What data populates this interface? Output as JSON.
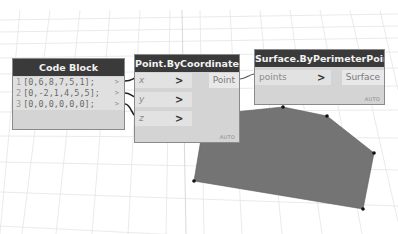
{
  "workspace": {
    "background": "#ffffff",
    "grid_color": "#e4e4e4",
    "geometry": {
      "surface_fill": "#747474",
      "vertices": [
        [
          283,
          107
        ],
        [
          327,
          116
        ],
        [
          374,
          153
        ],
        [
          363,
          209
        ],
        [
          194,
          181
        ]
      ]
    }
  },
  "nodes": {
    "code_block": {
      "title": "Code Block",
      "lines": [
        {
          "number": "1",
          "code": "[0,6,8,7,5,1];",
          "output_marker": ">"
        },
        {
          "number": "2",
          "code": "[0,-2,1,4,5,5];",
          "output_marker": ">"
        },
        {
          "number": "3",
          "code": "[0,0,0,0,0,0];",
          "output_marker": ">"
        }
      ]
    },
    "point_by_coordinates": {
      "title": "Point.ByCoordinates",
      "inputs": [
        {
          "name": "x",
          "chevron": ">"
        },
        {
          "name": "y",
          "chevron": ">"
        },
        {
          "name": "z",
          "chevron": ">"
        }
      ],
      "output": "Point",
      "lacing": "AUTO"
    },
    "surface_by_perimeter_points": {
      "title": "Surface.ByPerimeterPoints",
      "inputs": [
        {
          "name": "points",
          "chevron": ">"
        }
      ],
      "output": "Surface",
      "lacing": "AUTO"
    }
  }
}
